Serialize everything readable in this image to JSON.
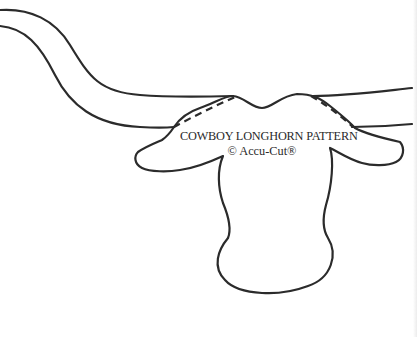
{
  "pattern": {
    "title": "COWBOY LONGHORN PATTERN",
    "copyright": "© Accu-Cut®"
  },
  "colors": {
    "background": "#ffffff",
    "outline": "#2b2b2b",
    "text": "#2a2a2a"
  },
  "shapes": {
    "horn_left": "long sweeping horn extending to top-left edge",
    "horn_right": "horn extending to right edge",
    "ears": "left and right ears",
    "head": "cow head with narrowing snout",
    "fold_lines": "dashed fold lines at horn joins"
  }
}
